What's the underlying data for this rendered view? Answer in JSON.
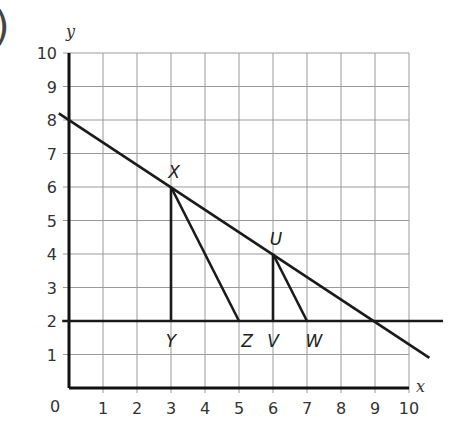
{
  "figure": {
    "corner_mark": ")"
  },
  "chart_data": {
    "type": "line",
    "title": "",
    "xlabel": "x",
    "ylabel": "y",
    "xlim": [
      0,
      10
    ],
    "ylim": [
      0,
      10
    ],
    "grid": true,
    "origin_label": "0",
    "x_ticks": [
      "1",
      "2",
      "3",
      "4",
      "5",
      "6",
      "7",
      "8",
      "9",
      "10"
    ],
    "y_ticks": [
      "1",
      "2",
      "3",
      "4",
      "5",
      "6",
      "7",
      "8",
      "9",
      "10"
    ],
    "series": [
      {
        "name": "sloped line",
        "points": [
          [
            -0.3,
            8.2
          ],
          [
            10.6,
            0.9
          ]
        ],
        "passes_through": [
          [
            0,
            8
          ],
          [
            3,
            6
          ],
          [
            6,
            4
          ],
          [
            9,
            2
          ]
        ]
      },
      {
        "name": "horizontal line y=2",
        "points": [
          [
            -0.2,
            2
          ],
          [
            11.0,
            2
          ]
        ]
      },
      {
        "name": "XY",
        "points": [
          [
            3,
            6
          ],
          [
            3,
            2
          ]
        ]
      },
      {
        "name": "XZ",
        "points": [
          [
            3,
            6
          ],
          [
            5,
            2
          ]
        ]
      },
      {
        "name": "UV",
        "points": [
          [
            6,
            4
          ],
          [
            6,
            2
          ]
        ]
      },
      {
        "name": "UW",
        "points": [
          [
            6,
            4
          ],
          [
            7,
            2
          ]
        ]
      }
    ],
    "annotations": [
      {
        "label": "X",
        "x": 3,
        "y": 6
      },
      {
        "label": "U",
        "x": 6,
        "y": 4
      },
      {
        "label": "Y",
        "x": 3,
        "y": 2
      },
      {
        "label": "Z",
        "x": 5,
        "y": 2
      },
      {
        "label": "V",
        "x": 6,
        "y": 2
      },
      {
        "label": "W",
        "x": 7,
        "y": 2
      }
    ]
  }
}
